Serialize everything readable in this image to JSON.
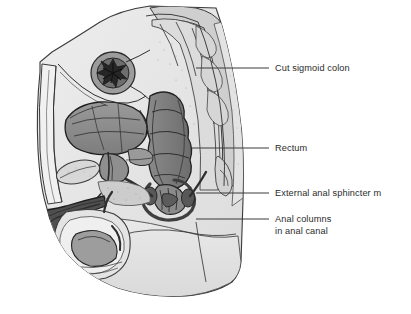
{
  "figure": {
    "type": "medical-illustration",
    "style": "grayscale line drawing",
    "background_color": "#ffffff",
    "outline_color": "#2e2e2e",
    "leader_color": "#3a3a3a",
    "text_color": "#2b2b2b",
    "palette": {
      "body_fill": "#e6e6e6",
      "soft_tissue": "#d2d2d2",
      "bone": "#c9c9c9",
      "bladder": "#8d8d8d",
      "rectum": "#7a7a7a",
      "dark_muscle": "#4a4a4a",
      "very_dark": "#3a3a3a",
      "pale": "#f2f2f2"
    }
  },
  "labels": [
    {
      "id": "cut-sigmoid-colon",
      "lines": [
        "Cut sigmoid colon"
      ],
      "text_x": 275,
      "text_y": 71,
      "leader_x1": 196,
      "leader_y1": 68,
      "leader_x2": 269,
      "leader_y2": 68
    },
    {
      "id": "rectum",
      "lines": [
        "Rectum"
      ],
      "text_x": 275,
      "text_y": 151,
      "leader_x1": 190,
      "leader_y1": 148,
      "leader_x2": 269,
      "leader_y2": 148
    },
    {
      "id": "external-anal-sphincter",
      "lines": [
        "External anal sphincter m"
      ],
      "text_x": 275,
      "text_y": 196,
      "leader_x1": 196,
      "leader_y1": 193,
      "leader_x2": 269,
      "leader_y2": 193
    },
    {
      "id": "anal-columns",
      "lines": [
        "Anal columns",
        "in anal canal"
      ],
      "text_x": 275,
      "text_y": 222,
      "leader_x1": 196,
      "leader_y1": 219,
      "leader_x2": 269,
      "leader_y2": 219
    }
  ]
}
